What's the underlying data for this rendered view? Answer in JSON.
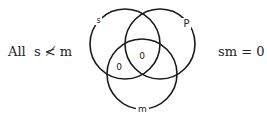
{
  "proposition": {
    "text": "All  s ≮ m"
  },
  "equation": {
    "text": "sm = 0"
  },
  "venn": {
    "circles": [
      {
        "label": "s",
        "cx": 125,
        "cy": 44,
        "r": 35
      },
      {
        "label": "P",
        "cx": 160,
        "cy": 44,
        "r": 35
      },
      {
        "label": "m",
        "cx": 142,
        "cy": 74,
        "r": 35
      }
    ],
    "region_marks": [
      {
        "text": "0",
        "x": 119,
        "y": 70,
        "region": "s-only-with-m"
      },
      {
        "text": "0",
        "x": 142,
        "y": 59,
        "region": "s-P-m"
      }
    ],
    "labels": {
      "s": "s",
      "P": "P",
      "m": "m"
    }
  }
}
